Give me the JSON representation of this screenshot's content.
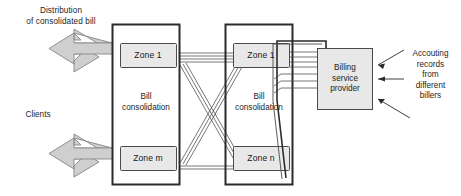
{
  "diagram": {
    "title_hidden": "",
    "annotations": {
      "distribution": "Distribution\nof consolidated bill",
      "clients": "Clients",
      "accounting": "Accouting\nrecords\nfrom\ndifferent\nbillers"
    },
    "containers": [
      {
        "id": "left-consolidator",
        "inner_label": "Bill\nconsolidation",
        "zones": [
          {
            "id": "zone-1-left",
            "label": "Zone 1"
          },
          {
            "id": "zone-m-left",
            "label": "Zone m"
          }
        ]
      },
      {
        "id": "right-consolidator",
        "inner_label": "Bill\nconsolidation",
        "zones": [
          {
            "id": "zone-1-right",
            "label": "Zone 1"
          },
          {
            "id": "zone-n-right",
            "label": "Zone n"
          }
        ]
      }
    ],
    "billing_service_provider": {
      "label": "Billing\nservice\nprovider"
    },
    "colors": {
      "stroke": "#2b2b2b",
      "line": "#555555",
      "box_fill": "#e6e6e6",
      "arrow_fill": "#cfcfcf",
      "arrow_stroke": "#8d8d8d",
      "background": "#ffffff",
      "text": "#1d1d1d"
    }
  }
}
